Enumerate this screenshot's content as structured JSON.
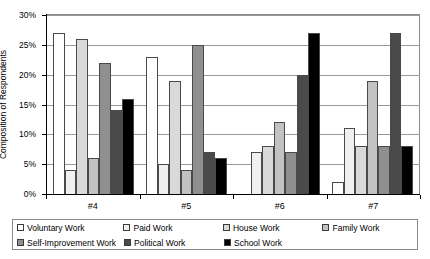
{
  "chart_data": {
    "type": "bar",
    "title": "",
    "xlabel": "",
    "ylabel": "Composition of Respondents",
    "categories": [
      "#4",
      "#5",
      "#6",
      "#7"
    ],
    "ylim": [
      0,
      30
    ],
    "ytick_values": [
      0,
      5,
      10,
      15,
      20,
      25,
      30
    ],
    "ytick_labels": [
      "0%",
      "5%",
      "10%",
      "15%",
      "20%",
      "25%",
      "30%"
    ],
    "grid": true,
    "legend_position": "bottom",
    "series": [
      {
        "name": "Voluntary Work",
        "color": "#ffffff",
        "values": [
          27,
          23,
          0,
          2
        ]
      },
      {
        "name": "Paid Work",
        "color": "#f0f0f0",
        "values": [
          4,
          5,
          7,
          11
        ]
      },
      {
        "name": "House Work",
        "color": "#d9d9d9",
        "values": [
          26,
          19,
          8,
          8
        ]
      },
      {
        "name": "Family Work",
        "color": "#c2c2c2",
        "values": [
          6,
          4,
          12,
          19
        ]
      },
      {
        "name": "Self-Improvement Work",
        "color": "#8f8f8f",
        "values": [
          22,
          25,
          7,
          8
        ]
      },
      {
        "name": "Political Work",
        "color": "#4a4a4a",
        "values": [
          14,
          7,
          20,
          27
        ]
      },
      {
        "name": "School Work",
        "color": "#000000",
        "values": [
          16,
          6,
          27,
          8
        ]
      }
    ]
  },
  "axis": {
    "y_title": "Composition of Respondents"
  },
  "legend": {
    "items": [
      {
        "label": "Voluntary Work",
        "color": "#ffffff"
      },
      {
        "label": "Paid Work",
        "color": "#f0f0f0"
      },
      {
        "label": "House Work",
        "color": "#d9d9d9"
      },
      {
        "label": "Family Work",
        "color": "#c2c2c2"
      },
      {
        "label": "Self-Improvement Work",
        "color": "#8f8f8f"
      },
      {
        "label": "Political Work",
        "color": "#4a4a4a"
      },
      {
        "label": "School Work",
        "color": "#000000"
      }
    ]
  }
}
